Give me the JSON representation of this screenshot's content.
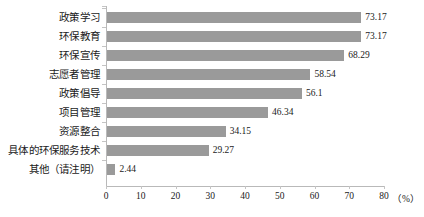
{
  "chart_data": {
    "type": "bar",
    "orientation": "horizontal",
    "title": "",
    "xlabel": "（%）",
    "ylabel": "",
    "xlim": [
      0,
      80
    ],
    "xticks": [
      0,
      10,
      20,
      30,
      40,
      50,
      60,
      70,
      80
    ],
    "grid": false,
    "legend": false,
    "bar_color": "#9a9a9a",
    "axis_color": "#b9b9b9",
    "text_color": "#1a1a1a",
    "categories": [
      "政策学习",
      "环保教育",
      "环保宣传",
      "志愿者管理",
      "政策倡导",
      "项目管理",
      "资源整合",
      "具体的环保服务技术",
      "其他（请注明）"
    ],
    "values": [
      73.17,
      73.17,
      68.29,
      58.54,
      56.1,
      46.34,
      34.15,
      29.27,
      2.44
    ],
    "value_labels": [
      "73.17",
      "73.17",
      "68.29",
      "58.54",
      "56.1",
      "46.34",
      "34.15",
      "29.27",
      "2.44"
    ],
    "xtick_labels": [
      "0",
      "10",
      "20",
      "30",
      "40",
      "50",
      "60",
      "70",
      "80"
    ],
    "unit_label": "（%）"
  }
}
